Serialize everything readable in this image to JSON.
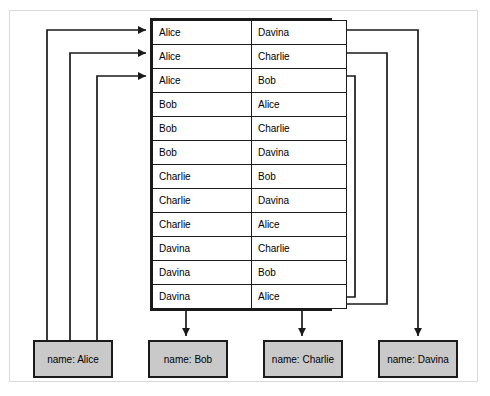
{
  "figure": {
    "colors": {
      "outer_frame": "#d9d9d9",
      "line": "#1a1a1a",
      "table_border": "#1a1a1a",
      "node_fill": "#c9c9c9",
      "background": "#ffffff"
    }
  },
  "join_table": {
    "columns": [
      "left",
      "right"
    ],
    "rows": [
      {
        "left": "Alice",
        "right": "Davina"
      },
      {
        "left": "Alice",
        "right": "Charlie"
      },
      {
        "left": "Alice",
        "right": "Bob"
      },
      {
        "left": "Bob",
        "right": "Alice"
      },
      {
        "left": "Bob",
        "right": "Charlie"
      },
      {
        "left": "Bob",
        "right": "Davina"
      },
      {
        "left": "Charlie",
        "right": "Bob"
      },
      {
        "left": "Charlie",
        "right": "Davina"
      },
      {
        "left": "Charlie",
        "right": "Alice"
      },
      {
        "left": "Davina",
        "right": "Charlie"
      },
      {
        "left": "Davina",
        "right": "Bob"
      },
      {
        "left": "Davina",
        "right": "Alice"
      }
    ]
  },
  "nodes": [
    {
      "id": "alice",
      "label": "name: Alice"
    },
    {
      "id": "bob",
      "label": "name: Bob"
    },
    {
      "id": "charlie",
      "label": "name: Charlie"
    },
    {
      "id": "davina",
      "label": "name: Davina"
    }
  ],
  "connections": {
    "into_table_from_alice": [
      {
        "target_row": 1,
        "note": "arrow points into row 1 left cell"
      },
      {
        "target_row": 2,
        "note": "arrow points into row 2 left cell"
      },
      {
        "target_row": 3,
        "note": "arrow points into row 3 left cell"
      }
    ],
    "out_of_table_to_nodes": [
      {
        "source_row": 3,
        "target_node": "bob"
      },
      {
        "source_row": 2,
        "target_node": "charlie"
      },
      {
        "source_row": 1,
        "target_node": "davina"
      }
    ]
  }
}
